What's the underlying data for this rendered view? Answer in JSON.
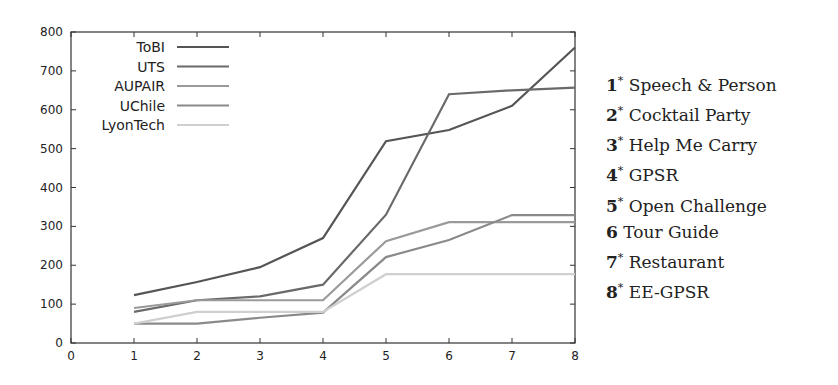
{
  "chart_data": {
    "type": "line",
    "title": "",
    "xlabel": "",
    "ylabel": "",
    "xlim": [
      0,
      8
    ],
    "ylim": [
      0,
      800
    ],
    "x_ticks": [
      0,
      1,
      2,
      3,
      4,
      5,
      6,
      7,
      8
    ],
    "y_ticks": [
      0,
      100,
      200,
      300,
      400,
      500,
      600,
      700,
      800
    ],
    "grid": false,
    "legend_position": "top-left",
    "x": [
      1,
      2,
      3,
      4,
      5,
      6,
      7,
      8
    ],
    "series": [
      {
        "name": "ToBI",
        "color": "#555555",
        "values": [
          123,
          157,
          195,
          270,
          519,
          548,
          610,
          760
        ]
      },
      {
        "name": "UTS",
        "color": "#6a6a6a",
        "values": [
          80,
          110,
          120,
          150,
          330,
          640,
          650,
          657
        ]
      },
      {
        "name": "AUPAIR",
        "color": "#9a9a9a",
        "values": [
          90,
          110,
          110,
          110,
          262,
          311,
          311,
          311
        ]
      },
      {
        "name": "UChile",
        "color": "#8a8a8a",
        "values": [
          50,
          50,
          65,
          78,
          221,
          265,
          329,
          329
        ]
      },
      {
        "name": "LyonTech",
        "color": "#cfcfcf",
        "values": [
          50,
          80,
          80,
          80,
          177,
          177,
          177,
          177
        ]
      }
    ]
  },
  "task_legend": [
    {
      "num": "1",
      "star": "*",
      "label": "Speech & Person"
    },
    {
      "num": "2",
      "star": "*",
      "label": "Cocktail Party"
    },
    {
      "num": "3",
      "star": "*",
      "label": "Help Me Carry"
    },
    {
      "num": "4",
      "star": "*",
      "label": "GPSR"
    },
    {
      "num": "5",
      "star": "*",
      "label": "Open Challenge"
    },
    {
      "num": "6",
      "star": "",
      "label": "Tour Guide"
    },
    {
      "num": "7",
      "star": "*",
      "label": "Restaurant"
    },
    {
      "num": "8",
      "star": "*",
      "label": "EE-GPSR"
    }
  ]
}
